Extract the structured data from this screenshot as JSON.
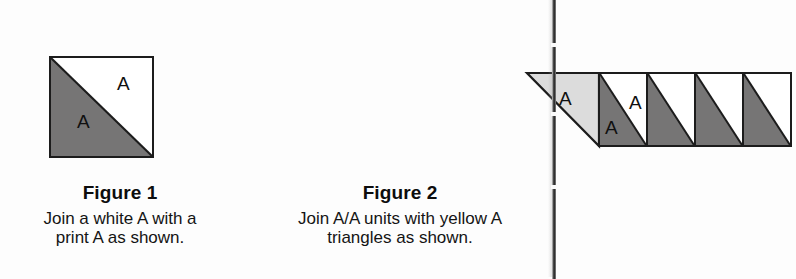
{
  "page": {
    "background_color": "#fdfdfd",
    "ink_color": "#141414"
  },
  "colors": {
    "print_triangle": "#767575",
    "yellow_triangle": "#dcdcdc",
    "white_triangle": "#ffffff",
    "outline": "#1c1c1c"
  },
  "figures": [
    {
      "id": "figure-1",
      "title": "Figure 1",
      "caption_lines": [
        "Join a white A with a",
        "print A as shown."
      ],
      "labels": {
        "white_a": "A",
        "print_a": "A"
      }
    },
    {
      "id": "figure-2",
      "title": "Figure 2",
      "caption_lines": [
        "Join A/A units with yellow A",
        "triangles as shown."
      ],
      "labels": {
        "yellow_a": "A",
        "white_a": "A",
        "print_a": "A"
      },
      "unit_count": 4
    }
  ],
  "scan_edge": {
    "present": true,
    "side": "right"
  }
}
